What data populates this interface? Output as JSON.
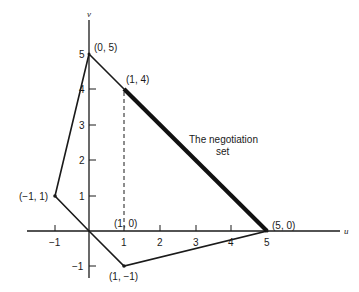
{
  "diagram": {
    "type": "bargaining-region",
    "axes": {
      "x_label": "u",
      "y_label": "v",
      "x_ticks": [
        "-1",
        "1",
        "2",
        "3",
        "4",
        "5"
      ],
      "y_ticks": [
        "-1",
        "1",
        "2",
        "3",
        "4",
        "5"
      ]
    },
    "points": [
      {
        "label": "(0, 5)",
        "x": 0,
        "y": 5
      },
      {
        "label": "(1, 4)",
        "x": 1,
        "y": 4
      },
      {
        "label": "(-1, 1)",
        "display": "(−1, 1)",
        "x": -1,
        "y": 1
      },
      {
        "label": "(1, 0)",
        "x": 1,
        "y": 0
      },
      {
        "label": "(5, 0)",
        "x": 5,
        "y": 0
      },
      {
        "label": "(1, -1)",
        "display": "(1, −1)",
        "x": 1,
        "y": -1
      }
    ],
    "polygon": [
      [
        0,
        5
      ],
      [
        5,
        0
      ],
      [
        1,
        -1
      ],
      [
        0,
        0
      ],
      [
        -1,
        1
      ],
      [
        0,
        5
      ]
    ],
    "negotiation_set": {
      "from": [
        1,
        4
      ],
      "to": [
        5,
        0
      ]
    },
    "dashed_line": {
      "from": [
        1,
        4
      ],
      "to": [
        1,
        0
      ]
    },
    "annotation": {
      "line1": "The negotiation",
      "line2": "set"
    }
  },
  "labels": {
    "p05": "(0, 5)",
    "p14": "(1, 4)",
    "pm11": "(−1, 1)",
    "p10": "(1, 0)",
    "p50": "(5, 0)",
    "p1m1": "(1, −1)",
    "x_axis": "u",
    "y_axis": "v",
    "tx_m1": "−1",
    "tx_1": "1",
    "tx_2": "2",
    "tx_3": "3",
    "tx_4": "4",
    "tx_5": "5",
    "ty_m1": "−1",
    "ty_1": "1",
    "ty_2": "2",
    "ty_3": "3",
    "ty_4": "4",
    "ty_5": "5",
    "annot1": "The negotiation",
    "annot2": "set"
  }
}
